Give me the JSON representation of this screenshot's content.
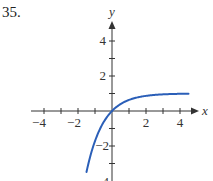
{
  "problem": {
    "number": "35."
  },
  "colors": {
    "curve": "#2b5fb8",
    "axis": "#333333"
  },
  "chart_data": {
    "type": "line",
    "title": "",
    "xlabel": "x",
    "ylabel": "y",
    "xlim": [
      -4.7,
      4.9
    ],
    "ylim": [
      -4,
      5.2
    ],
    "grid": false,
    "x_ticks": [
      -4,
      -3,
      -2,
      -1,
      1,
      2,
      3,
      4
    ],
    "x_tick_labels": [
      "-4",
      "-2",
      "2",
      "4"
    ],
    "y_ticks": [
      -4,
      -3,
      -2,
      -1,
      1,
      2,
      3,
      4
    ],
    "y_tick_labels": [
      "4",
      "2",
      "-2",
      "-4"
    ],
    "series": [
      {
        "name": "y = 1 - e^(-x)",
        "x": [
          -1.5,
          -1.25,
          -1,
          -0.75,
          -0.5,
          -0.25,
          0,
          0.5,
          1,
          1.5,
          2,
          2.5,
          3,
          3.5,
          4,
          4.5
        ],
        "y": [
          -3.48,
          -2.49,
          -1.72,
          -1.12,
          -0.65,
          -0.28,
          0,
          0.39,
          0.63,
          0.78,
          0.86,
          0.92,
          0.95,
          0.97,
          0.98,
          0.99
        ]
      }
    ],
    "annotations": []
  },
  "labels": {
    "x_axis": "x",
    "y_axis": "y",
    "xt_m4": "−4",
    "xt_m2": "−2",
    "xt_2": "2",
    "xt_4": "4",
    "yt_4": "4",
    "yt_2": "2",
    "yt_m2": "−2",
    "yt_m4": "−4"
  }
}
